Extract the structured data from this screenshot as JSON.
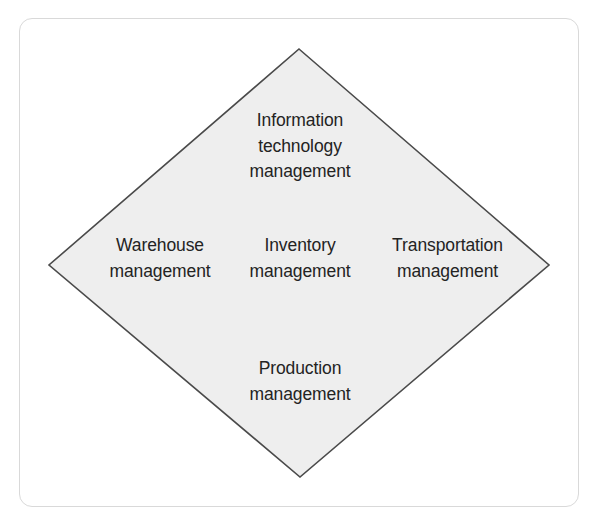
{
  "figure": {
    "type": "diamond-concept-diagram",
    "shape_name": "diamond",
    "frame": {
      "border_color": "#d9d9d9",
      "background_color": "#ffffff",
      "corner_radius": 13
    },
    "diamond": {
      "fill_color": "#eeeeee",
      "stroke_color": "#4a4a4a",
      "stroke_width": 1.6,
      "vertices": {
        "top": {
          "x": 299,
          "y": 49
        },
        "left": {
          "x": 49,
          "y": 265
        },
        "right": {
          "x": 549,
          "y": 265
        },
        "bottom": {
          "x": 300,
          "y": 477
        }
      }
    },
    "text_color": "#232323",
    "nodes": [
      {
        "id": "information-technology-management",
        "position": "top",
        "label": "Information\ntechnology\nmanagement"
      },
      {
        "id": "warehouse-management",
        "position": "left",
        "label": "Warehouse\nmanagement"
      },
      {
        "id": "inventory-management",
        "position": "center",
        "label": "Inventory\nmanagement"
      },
      {
        "id": "transportation-management",
        "position": "right",
        "label": "Transportation\nmanagement"
      },
      {
        "id": "production-management",
        "position": "bottom",
        "label": "Production\nmanagement"
      }
    ]
  }
}
